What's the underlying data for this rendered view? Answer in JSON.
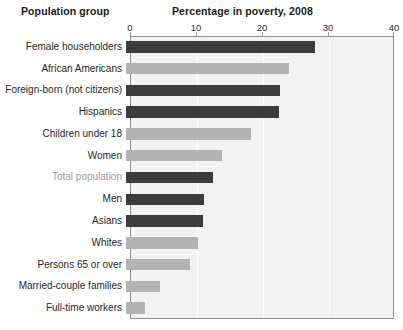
{
  "headers": {
    "group_column": "Population group",
    "value_column": "Percentage in poverty, 2008"
  },
  "colors": {
    "bar_dark": "#3c3c3c",
    "bar_light": "#b3b3b3",
    "plot_background": "#f2f2f2",
    "plot_border": "#8d8d8d",
    "label_text": "#1f1f1f",
    "label_muted": "#9d9d9d"
  },
  "chart_data": {
    "type": "bar",
    "orientation": "horizontal",
    "title": "Percentage in poverty, 2008",
    "xlabel": "",
    "ylabel": "Population group",
    "xlim": [
      0,
      40
    ],
    "xticks": [
      0,
      10,
      20,
      30,
      40
    ],
    "xtick_labels": [
      "0",
      "10",
      "20",
      "30",
      "40"
    ],
    "grid": true,
    "legend": "none",
    "categories": [
      "Female householders",
      "African Americans",
      "Foreign-born (not citizens)",
      "Hispanics",
      "Children under 18",
      "Women",
      "Total population",
      "Men",
      "Asians",
      "Whites",
      "Persons 65 or over",
      "Married-couple families",
      "Full-time workers"
    ],
    "values": [
      28.7,
      24.7,
      23.3,
      23.2,
      19.0,
      14.6,
      13.2,
      11.8,
      11.6,
      10.9,
      9.7,
      5.1,
      2.9
    ],
    "bar_shades": [
      "dark",
      "light",
      "dark",
      "dark",
      "light",
      "light",
      "dark",
      "dark",
      "dark",
      "light",
      "light",
      "light",
      "light"
    ],
    "highlighted_category": "Total population"
  }
}
